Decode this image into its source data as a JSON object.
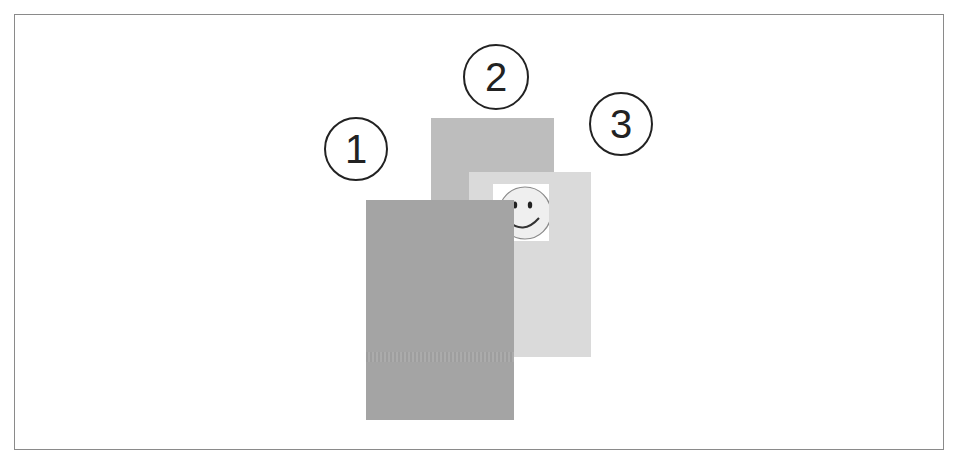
{
  "diagram": {
    "labels": [
      {
        "id": "1",
        "text": "1"
      },
      {
        "id": "2",
        "text": "2"
      },
      {
        "id": "3",
        "text": "3"
      }
    ],
    "layers": [
      {
        "id": "1",
        "color": "#a4a4a4",
        "position": "front"
      },
      {
        "id": "2",
        "color": "#bdbdbd",
        "position": "back"
      },
      {
        "id": "3",
        "color": "#dadada",
        "position": "middle",
        "content": "smiley-face-icon"
      }
    ],
    "colors": {
      "frame_border": "#8a8a8a",
      "label_stroke": "#222222",
      "background": "#ffffff"
    }
  }
}
